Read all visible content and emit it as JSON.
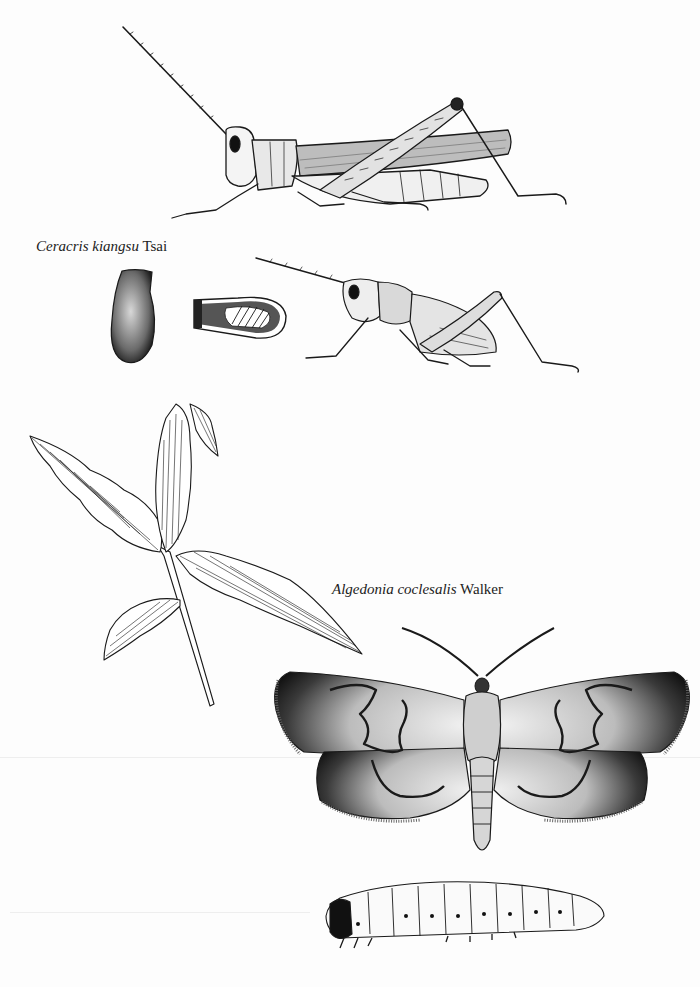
{
  "plate": {
    "background": "#fdfdfd",
    "ink": "#1a1a1a",
    "figures": [
      {
        "id": "grasshopper-adult",
        "label": "adult grasshopper, lateral view"
      },
      {
        "id": "egg-pod",
        "label": "egg pod"
      },
      {
        "id": "egg-pod-section",
        "label": "egg pod cross-section"
      },
      {
        "id": "grasshopper-nymph",
        "label": "nymph, lateral view"
      },
      {
        "id": "bamboo-damage",
        "label": "damaged bamboo leaves"
      },
      {
        "id": "moth-adult",
        "label": "adult moth, dorsal view"
      },
      {
        "id": "larva",
        "label": "larva, lateral view"
      }
    ]
  },
  "captions": {
    "ceracris": {
      "genus_species": "Ceracris kiangsu",
      "author": "Tsai"
    },
    "algedonia": {
      "genus_species": "Algedonia coclesalis",
      "author": "Walker"
    }
  }
}
